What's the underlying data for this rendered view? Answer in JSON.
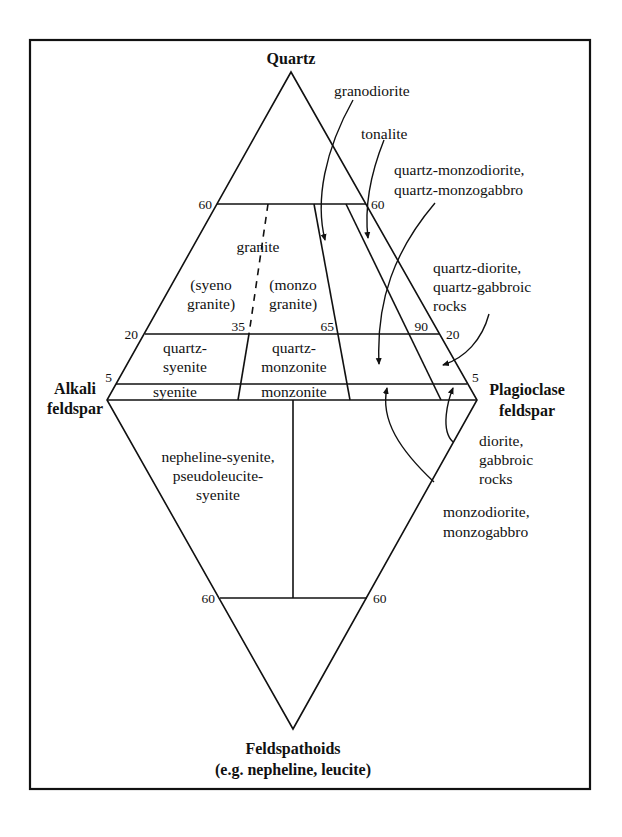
{
  "vertices": {
    "top": "Quartz",
    "left_line1": "Alkali",
    "left_line2": "feldspar",
    "right_line1": "Plagioclase",
    "right_line2": "feldspar",
    "bottom_line1": "Feldspathoids",
    "bottom_line2": "(e.g. nepheline, leucite)"
  },
  "tick_labels": {
    "q60_left": "60",
    "q60_right": "60",
    "q20_left": "20",
    "q20_right": "20",
    "q5_left": "5",
    "q5_right": "5",
    "p35": "35",
    "p65": "65",
    "p90": "90",
    "f60_left": "60",
    "f60_right": "60"
  },
  "fields": {
    "granite": "granite",
    "syenogranite_1": "(syeno",
    "syenogranite_2": "granite)",
    "monzogranite_1": "(monzo",
    "monzogranite_2": "granite)",
    "quartz_syenite_1": "quartz-",
    "quartz_syenite_2": "syenite",
    "quartz_monzonite_1": "quartz-",
    "quartz_monzonite_2": "monzonite",
    "syenite": "syenite",
    "monzonite": "monzonite",
    "nepheline_syenite_1": "nepheline-syenite,",
    "nepheline_syenite_2": "pseudoleucite-",
    "nepheline_syenite_3": "syenite"
  },
  "callouts": {
    "granodiorite": "granodiorite",
    "tonalite": "tonalite",
    "qmonzodiorite_1": "quartz-monzodiorite,",
    "qmonzodiorite_2": "quartz-monzogabbro",
    "qdiorite_1": "quartz-diorite,",
    "qdiorite_2": "quartz-gabbroic",
    "qdiorite_3": "rocks",
    "diorite_1": "diorite,",
    "diorite_2": "gabbroic",
    "diorite_3": "rocks",
    "monzodiorite_1": "monzodiorite,",
    "monzodiorite_2": "monzogabbro"
  }
}
